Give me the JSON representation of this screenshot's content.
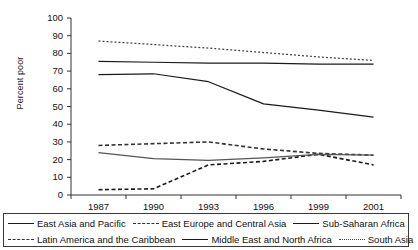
{
  "chart_data": {
    "type": "line",
    "title": "",
    "subtitle": "",
    "xlabel": "",
    "ylabel": "Percent poor",
    "x": [
      "1987",
      "1990",
      "1993",
      "1996",
      "1999",
      "2001"
    ],
    "xlim": [
      "1987",
      "2001"
    ],
    "ylim": [
      0,
      100
    ],
    "yticks": [
      0,
      10,
      20,
      30,
      40,
      50,
      60,
      70,
      80,
      90,
      100
    ],
    "grid": false,
    "legend_position": "bottom",
    "series": [
      {
        "name": "East Asia and Pacific",
        "style": "solid",
        "color": "#1a1a1a",
        "values": [
          68,
          68.5,
          64,
          51.5,
          48,
          44
        ]
      },
      {
        "name": "East Europe and Central Asia",
        "style": "dashed",
        "color": "#1a1a1a",
        "values": [
          3,
          3.5,
          17,
          19,
          23,
          17
        ]
      },
      {
        "name": "Sub-Saharan Africa",
        "style": "solid",
        "color": "#1a1a1a",
        "values": [
          75.5,
          75,
          74.5,
          74.5,
          74,
          74
        ]
      },
      {
        "name": "Latin America and the Caribbean",
        "style": "dashed",
        "color": "#333333",
        "values": [
          28,
          29,
          30,
          26,
          23.5,
          22.5
        ]
      },
      {
        "name": "Middle East and North Africa",
        "style": "solid",
        "color": "#555555",
        "values": [
          24,
          20.5,
          19.5,
          21,
          23,
          22.5
        ]
      },
      {
        "name": "South Asia",
        "style": "dotted",
        "color": "#444444",
        "values": [
          87,
          85,
          83,
          80.5,
          78,
          76
        ]
      }
    ]
  },
  "axis": {
    "y_title": "Percent poor",
    "y_tick_labels": [
      "100",
      "90",
      "80",
      "70",
      "60",
      "50",
      "40",
      "30",
      "20",
      "10",
      "0"
    ],
    "x_tick_labels": [
      "1987",
      "1990",
      "1993",
      "1996",
      "1999",
      "2001"
    ]
  },
  "legend": {
    "rows": [
      [
        {
          "label": "East Asia and Pacific",
          "style": "solid"
        },
        {
          "label": "East Europe and Central Asia",
          "style": "fine-dashed"
        },
        {
          "label": "Sub-Saharan Africa",
          "style": "solid"
        }
      ],
      [
        {
          "label": "Latin America and the Caribbean",
          "style": "fine-dashed"
        },
        {
          "label": "Middle East and North Africa",
          "style": "solid"
        },
        {
          "label": "South Asia",
          "style": "dotted"
        }
      ]
    ]
  }
}
